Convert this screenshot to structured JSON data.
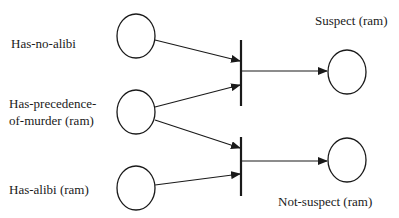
{
  "diagram": {
    "type": "petri-net",
    "places": {
      "has_no_alibi": {
        "label": "Has-no-alibi"
      },
      "has_precedence": {
        "label_line1": "Has-precedence-",
        "label_line2": "of-murder (ram)"
      },
      "has_alibi": {
        "label": "Has-alibi (ram)"
      },
      "suspect": {
        "label": "Suspect (ram)"
      },
      "not_suspect": {
        "label": "Not-suspect (ram)"
      }
    },
    "transitions": [
      {
        "id": "t1",
        "inputs": [
          "Has-no-alibi",
          "Has-precedence-of-murder (ram)"
        ],
        "output": "Suspect (ram)"
      },
      {
        "id": "t2",
        "inputs": [
          "Has-precedence-of-murder (ram)",
          "Has-alibi (ram)"
        ],
        "output": "Not-suspect (ram)"
      }
    ],
    "colors": {
      "stroke": "#1a1a1a",
      "background": "#ffffff"
    }
  }
}
